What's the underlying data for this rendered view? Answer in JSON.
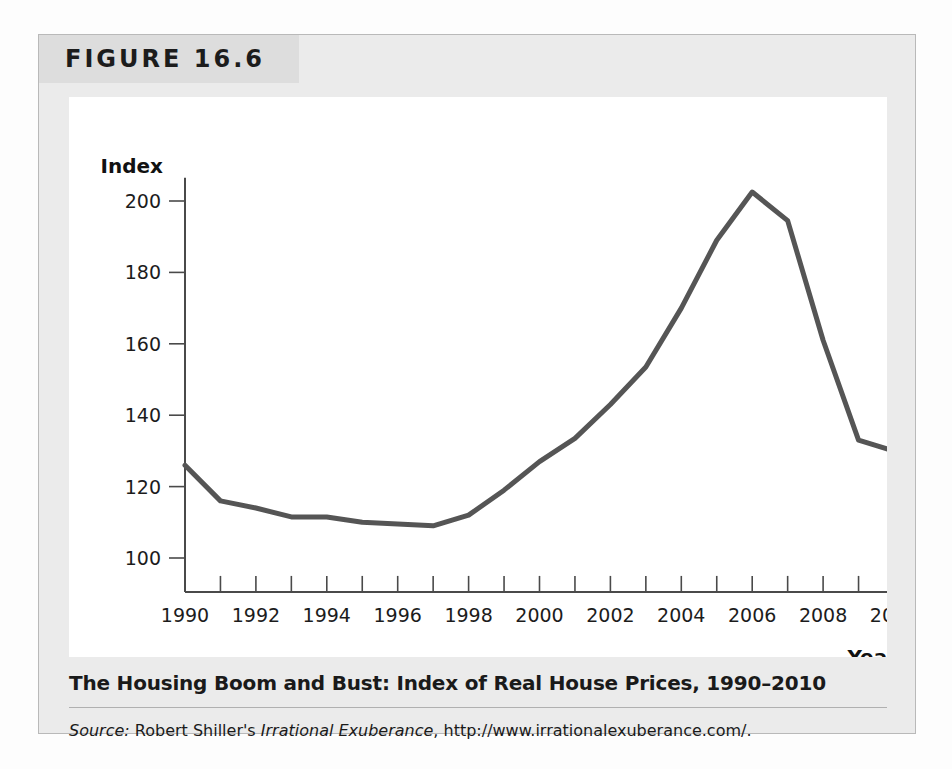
{
  "figure": {
    "number_label": "FIGURE 16.6",
    "caption_title": "The Housing Boom and Bust: Index of Real House Prices, 1990–2010",
    "source_prefix": "Source:",
    "source_author": " Robert Shiller's ",
    "source_work": "Irrational Exuberance",
    "source_url": ", http://www.irrationalexuberance.com/."
  },
  "colors": {
    "line": "#555555",
    "axis": "#4a4a4a",
    "card_background": "#ebebeb",
    "header_background": "#dddddd",
    "plot_background": "#ffffff"
  },
  "chart_data": {
    "type": "line",
    "title": "The Housing Boom and Bust: Index of Real House Prices, 1990–2010",
    "xlabel": "Year",
    "ylabel": "Index",
    "xlim": [
      1990,
      2010
    ],
    "ylim": [
      90,
      207
    ],
    "grid": false,
    "legend": false,
    "y_ticks": [
      100,
      120,
      140,
      160,
      180,
      200
    ],
    "y_tick_labels": [
      "100",
      "120",
      "140",
      "160",
      "180",
      "200"
    ],
    "x_ticks": [
      1990,
      1991,
      1992,
      1993,
      1994,
      1995,
      1996,
      1997,
      1998,
      1999,
      2000,
      2001,
      2002,
      2003,
      2004,
      2005,
      2006,
      2007,
      2008,
      2009,
      2010
    ],
    "x_tick_labels": [
      "1990",
      "",
      "1992",
      "",
      "1994",
      "",
      "1996",
      "",
      "1998",
      "",
      "2000",
      "",
      "2002",
      "",
      "2004",
      "",
      "2006",
      "",
      "2008",
      "",
      "2010"
    ],
    "x": [
      1990,
      1991,
      1992,
      1993,
      1994,
      1995,
      1996,
      1997,
      1998,
      1999,
      2000,
      2001,
      2002,
      2003,
      2004,
      2005,
      2006,
      2007,
      2008,
      2009,
      2010
    ],
    "values": [
      126,
      116,
      114,
      111.5,
      111.5,
      110,
      109.5,
      109,
      112,
      119,
      127,
      133.5,
      143,
      153.5,
      170,
      189,
      202.5,
      194.5,
      161,
      133,
      130
    ],
    "series_name": "Index of Real House Prices",
    "annotations": []
  }
}
